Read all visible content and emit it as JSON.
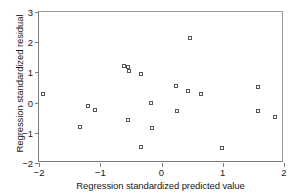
{
  "chart_data": {
    "type": "scatter",
    "title": "",
    "xlabel": "Regression standardized predicted value",
    "ylabel": "Regression standardized residual",
    "xlim": [
      -2,
      2
    ],
    "ylim": [
      -2,
      3
    ],
    "xticks": [
      -2,
      -1,
      0,
      1,
      2
    ],
    "yticks": [
      -2,
      -1,
      0,
      1,
      2,
      3
    ],
    "xtick_labels": [
      "-2",
      "-1",
      "0",
      "1",
      "2"
    ],
    "ytick_labels": [
      "-2",
      "-1",
      "0",
      "1",
      "2",
      "3"
    ],
    "grid": false,
    "legend": null,
    "marker": "open-square",
    "points": [
      {
        "x": -1.93,
        "y": 0.29
      },
      {
        "x": -1.33,
        "y": -0.81
      },
      {
        "x": -1.2,
        "y": -0.11
      },
      {
        "x": -1.08,
        "y": -0.24
      },
      {
        "x": -0.61,
        "y": 1.21
      },
      {
        "x": -0.55,
        "y": 1.18
      },
      {
        "x": -0.53,
        "y": 1.05
      },
      {
        "x": -0.55,
        "y": -0.56
      },
      {
        "x": -0.34,
        "y": 0.95
      },
      {
        "x": -0.33,
        "y": -1.47
      },
      {
        "x": -0.17,
        "y": -0.02
      },
      {
        "x": -0.16,
        "y": -0.83
      },
      {
        "x": 0.23,
        "y": 0.55
      },
      {
        "x": 0.25,
        "y": -0.28
      },
      {
        "x": 0.46,
        "y": 2.14
      },
      {
        "x": 0.44,
        "y": 0.4
      },
      {
        "x": 0.64,
        "y": 0.27
      },
      {
        "x": 0.98,
        "y": -1.5
      },
      {
        "x": 1.57,
        "y": 0.52
      },
      {
        "x": 1.57,
        "y": -0.29
      },
      {
        "x": 1.86,
        "y": -0.47
      }
    ]
  },
  "colors": {
    "marker_stroke": "#555555",
    "axis": "#7d7d7d",
    "text": "#1a1a1a",
    "background": "#ffffff"
  }
}
